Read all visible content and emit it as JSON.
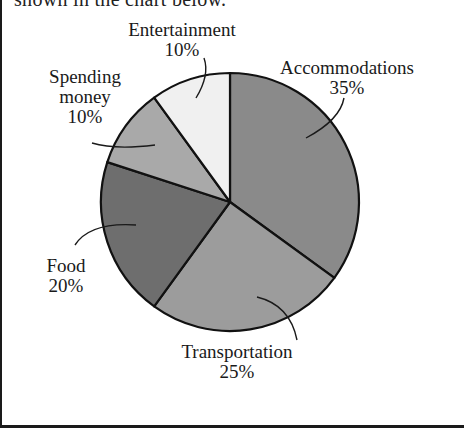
{
  "header": {
    "cut_text": "shown in the chart below."
  },
  "chart_data": {
    "type": "pie",
    "title": "",
    "start_angle_deg": 0,
    "direction": "clockwise",
    "slices": [
      {
        "label": "Accommodations",
        "value": 35,
        "pct_label": "35%",
        "color": "#8a8a8a"
      },
      {
        "label": "Transportation",
        "value": 25,
        "pct_label": "25%",
        "color": "#9c9c9c"
      },
      {
        "label": "Food",
        "value": 20,
        "pct_label": "20%",
        "color": "#6e6e6e"
      },
      {
        "label": "Spending money",
        "value": 10,
        "pct_label": "10%",
        "color": "#a9a9a9"
      },
      {
        "label": "Entertainment",
        "value": 10,
        "pct_label": "10%",
        "color": "#f0f0f0"
      }
    ],
    "legend": "none (direct labels with leader lines)"
  },
  "labels": {
    "accommodations": {
      "name": "Accommodations",
      "pct": "35%"
    },
    "transportation": {
      "name": "Transportation",
      "pct": "25%"
    },
    "food": {
      "name": "Food",
      "pct": "20%"
    },
    "spending": {
      "name1": "Spending",
      "name2": "money",
      "pct": "10%"
    },
    "entertainment": {
      "name": "Entertainment",
      "pct": "10%"
    }
  }
}
